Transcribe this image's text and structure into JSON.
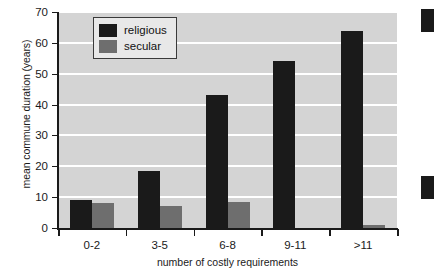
{
  "chart_data": {
    "type": "bar",
    "title": "",
    "xlabel": "number of costly requirements",
    "ylabel": "mean commune duration (years)",
    "categories": [
      "0-2",
      "3-5",
      "6-8",
      "9-11",
      ">11"
    ],
    "series": [
      {
        "name": "religious",
        "color": "#1a1a1a",
        "values": [
          9,
          18.5,
          43,
          54,
          64
        ]
      },
      {
        "name": "secular",
        "color": "#6e6e6e",
        "values": [
          8,
          7,
          8.5,
          0,
          1
        ]
      }
    ],
    "ylim": [
      0,
      70
    ],
    "yticks": [
      0,
      10,
      20,
      30,
      40,
      50,
      60,
      70
    ],
    "ytick_labels": [
      "0",
      "10",
      "20",
      "30",
      "40",
      "50",
      "60",
      "70"
    ],
    "grid": "horizontal-white-on-gray",
    "legend_position": "top-left-inside",
    "plot_background": "#d4d4d4",
    "gridline_color": "#ffffff",
    "axis_color": "#1a1a1a"
  },
  "legend": {
    "entries": [
      {
        "label": "religious",
        "color": "#1a1a1a"
      },
      {
        "label": "secular",
        "color": "#6e6e6e"
      }
    ]
  },
  "adjacent_figure_fragments": [
    {
      "name": "legend-swatch-fragment-top",
      "color": "#1a1a1a",
      "top": 9,
      "height": 23,
      "width": 13
    },
    {
      "name": "legend-swatch-fragment-bottom",
      "color": "#1a1a1a",
      "top": 176,
      "height": 23,
      "width": 13
    }
  ]
}
